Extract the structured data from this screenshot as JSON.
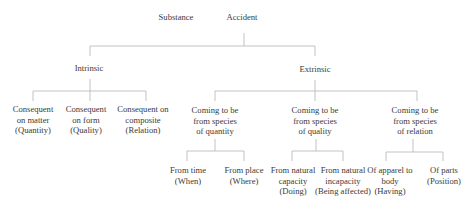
{
  "diagram": {
    "type": "tree",
    "colors": {
      "text": "#3a3a3a",
      "lines": "#b4b4b4",
      "background": "#ffffff"
    },
    "root": {
      "substance": {
        "label": "Substance"
      },
      "accident": {
        "label": "Accident"
      }
    },
    "level1": {
      "intrinsic": {
        "label": "Intrinsic"
      },
      "extrinsic": {
        "label": "Extrinsic"
      }
    },
    "intrinsic_children": [
      {
        "lines": [
          "Consequent",
          "on matter",
          "(Quantity)"
        ]
      },
      {
        "lines": [
          "Consequent",
          "on form",
          "(Quality)"
        ]
      },
      {
        "lines": [
          "Consequent on",
          "composite",
          "(Relation)"
        ]
      }
    ],
    "extrinsic_children": [
      {
        "lines": [
          "Coming to be",
          "from species",
          "of quantity"
        ]
      },
      {
        "lines": [
          "Coming to be",
          "from species",
          "of quality"
        ]
      },
      {
        "lines": [
          "Coming to be",
          "from species",
          "of relation"
        ]
      }
    ],
    "quantity_children": [
      {
        "lines": [
          "From time",
          "(When)"
        ]
      },
      {
        "lines": [
          "From place",
          "(Where)"
        ]
      }
    ],
    "quality_children": [
      {
        "lines": [
          "From natural",
          "capacity",
          "(Doing)"
        ]
      },
      {
        "lines": [
          "From natural",
          "incapacity",
          "(Being affected)"
        ]
      }
    ],
    "relation_children": [
      {
        "lines": [
          "Of apparel to",
          "body",
          "(Having)"
        ]
      },
      {
        "lines": [
          "Of parts",
          "(Position)"
        ]
      }
    ]
  }
}
